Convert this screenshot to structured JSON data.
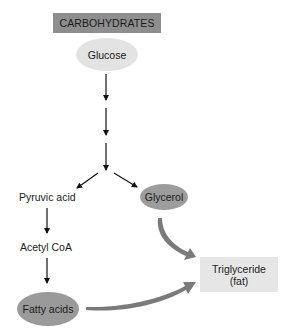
{
  "diagram": {
    "title": "CARBOHYDRATES",
    "nodes": {
      "glucose": "Glucose",
      "pyruvic_acid": "Pyruvic acid",
      "glycerol": "Glycerol",
      "acetyl_coa": "Acetyl CoA",
      "fatty_acids": "Fatty acids",
      "triglyceride_line1": "Triglyceride",
      "triglyceride_line2": "(fat)"
    },
    "edges": [
      {
        "from": "Glucose",
        "to": "(intermediate)",
        "style": "thin-arrow"
      },
      {
        "from": "(intermediate)",
        "to": "(intermediate)",
        "style": "thin-arrow"
      },
      {
        "from": "(intermediate)",
        "to": "branch",
        "style": "thin-arrow"
      },
      {
        "from": "branch",
        "to": "Pyruvic acid",
        "style": "thin-arrow"
      },
      {
        "from": "branch",
        "to": "Glycerol",
        "style": "thin-arrow"
      },
      {
        "from": "Pyruvic acid",
        "to": "Acetyl CoA",
        "style": "thin-arrow"
      },
      {
        "from": "Acetyl CoA",
        "to": "Fatty acids",
        "style": "thin-arrow"
      },
      {
        "from": "Glycerol",
        "to": "Triglyceride (fat)",
        "style": "thick-curved-arrow"
      },
      {
        "from": "Fatty acids",
        "to": "Triglyceride (fat)",
        "style": "thick-curved-arrow"
      }
    ],
    "colors": {
      "title_box": "#8e8e8e",
      "glucose": "#e3e3e3",
      "glycerol": "#9c9c9c",
      "fatty_acids": "#9a9a9a",
      "triglyceride_box": "#e6e6e6",
      "thick_arrow": "#7a7a7a"
    }
  }
}
